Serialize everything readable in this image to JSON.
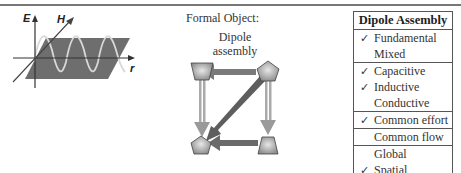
{
  "figure_left": {
    "axis_labels": {
      "e": "E",
      "h": "H",
      "r": "r"
    }
  },
  "formal_object": {
    "label": "Formal Object:",
    "title_line1": "Dipole",
    "title_line2": "assembly"
  },
  "table": {
    "header": "Dipole Assembly",
    "groups": [
      {
        "rows": [
          {
            "check": "✓",
            "label": "Fundamental"
          },
          {
            "check": "",
            "label": "Mixed"
          }
        ]
      },
      {
        "rows": [
          {
            "check": "✓",
            "label": "Capacitive"
          },
          {
            "check": "✓",
            "label": "Inductive"
          },
          {
            "check": "",
            "label": "Conductive"
          }
        ]
      },
      {
        "rows": [
          {
            "check": "✓",
            "label": "Common effort"
          }
        ]
      },
      {
        "rows": [
          {
            "check": "",
            "label": "Common flow"
          }
        ]
      },
      {
        "rows": [
          {
            "check": "",
            "label": "Global"
          },
          {
            "check": "✓",
            "label": "Spatial"
          }
        ]
      }
    ]
  },
  "colors": {
    "plane": "#6e6e6e",
    "wave": "#d8d8d8",
    "node_fill": "#9a9a9a",
    "arrow_light": "#a8a8a8",
    "arrow_dark": "#6a6a6a"
  }
}
